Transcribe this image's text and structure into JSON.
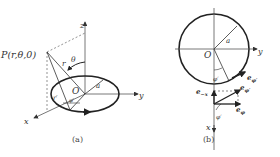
{
  "figure_a": {
    "caption": "(a)",
    "point_label": "P(r,θ,0)",
    "axes": {
      "x": "x",
      "y": "y",
      "z": "z"
    },
    "origin": "O",
    "labels": {
      "r": "r",
      "theta": "θ",
      "r_prime": "r′",
      "phi_prime": "φ′",
      "radius": "a"
    }
  },
  "figure_b": {
    "caption": "(b)",
    "origin": "O",
    "axes": {
      "x": "x",
      "y": "y"
    },
    "labels": {
      "radius": "a",
      "phi_prime": "φ′",
      "phi_prime_lower": "φ′",
      "e_phi_prime_on_circle": "e",
      "e_phi_prime_on_circle_sub": "φ′",
      "e_minus_x": "e",
      "e_minus_x_sub": "−x",
      "e_phi_prime": "e",
      "e_phi_prime_sub": "φ′",
      "e_phi": "e",
      "e_phi_sub": "φ"
    }
  }
}
